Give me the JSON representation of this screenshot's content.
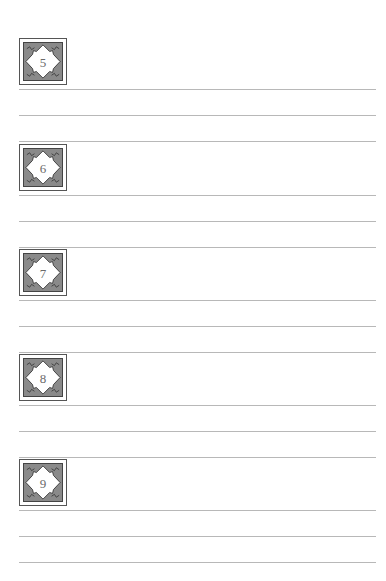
{
  "worksheet": {
    "sections": [
      {
        "number": "5",
        "icon": "ornate-diamond-badge-icon",
        "writing_lines": 3
      },
      {
        "number": "6",
        "icon": "ornate-diamond-badge-icon",
        "writing_lines": 3
      },
      {
        "number": "7",
        "icon": "ornate-diamond-badge-icon",
        "writing_lines": 3
      },
      {
        "number": "8",
        "icon": "ornate-diamond-badge-icon",
        "writing_lines": 3
      },
      {
        "number": "9",
        "icon": "ornate-diamond-badge-icon",
        "writing_lines": 3
      }
    ]
  },
  "colors": {
    "badge_frame": "#555555",
    "badge_fill": "#8a8a8a",
    "diamond": "#ffffff",
    "number_text": "#6a6a6a",
    "rule_line": "#b8b8b8"
  }
}
